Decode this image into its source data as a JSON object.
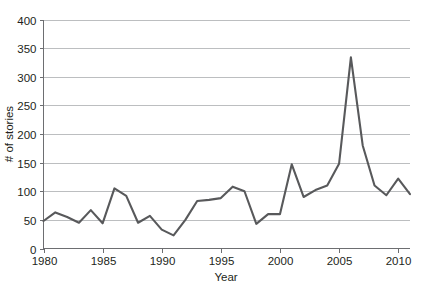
{
  "chart_data": {
    "type": "line",
    "title": "",
    "xlabel": "Year",
    "ylabel": "# of stories",
    "xlim": [
      1980,
      2011
    ],
    "ylim": [
      0,
      400
    ],
    "grid": true,
    "legend": false,
    "legend_position": "none",
    "x_ticks": [
      "1980",
      "1985",
      "1990",
      "1995",
      "2000",
      "2005",
      "2010"
    ],
    "x_tick_values": [
      1980,
      1985,
      1990,
      1995,
      2000,
      2005,
      2010
    ],
    "y_ticks": [
      "0",
      "50",
      "100",
      "150",
      "200",
      "250",
      "300",
      "350",
      "400"
    ],
    "y_tick_values": [
      0,
      50,
      100,
      150,
      200,
      250,
      300,
      350,
      400
    ],
    "line_color": "#58595b",
    "grid_color": "#bcbec0",
    "axis_color": "#6d6e71",
    "x": [
      1980,
      1981,
      1982,
      1983,
      1984,
      1985,
      1986,
      1987,
      1988,
      1989,
      1990,
      1991,
      1992,
      1993,
      1994,
      1995,
      1996,
      1997,
      1998,
      1999,
      2000,
      2001,
      2002,
      2003,
      2004,
      2005,
      2006,
      2007,
      2008,
      2009,
      2010,
      2011
    ],
    "values": [
      48,
      63,
      55,
      45,
      67,
      44,
      105,
      92,
      45,
      57,
      33,
      23,
      50,
      83,
      85,
      88,
      108,
      100,
      43,
      60,
      60,
      147,
      90,
      102,
      110,
      148,
      334,
      180,
      110,
      93,
      122,
      95
    ],
    "series": [
      {
        "name": "# of stories",
        "values": [
          48,
          63,
          55,
          45,
          67,
          44,
          105,
          92,
          45,
          57,
          33,
          23,
          50,
          83,
          85,
          88,
          108,
          100,
          43,
          60,
          60,
          147,
          90,
          102,
          110,
          148,
          334,
          180,
          110,
          93,
          122,
          95
        ]
      }
    ],
    "annotations": []
  }
}
